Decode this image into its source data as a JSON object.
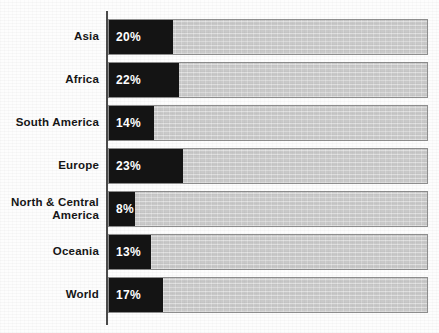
{
  "chart_data": {
    "type": "bar",
    "orientation": "horizontal",
    "title": "",
    "subtitle": "",
    "xlabel": "",
    "ylabel": "",
    "xlim": [
      0,
      100
    ],
    "grid": false,
    "legend": null,
    "value_suffix": "%",
    "categories": [
      "Asia",
      "Africa",
      "South America",
      "Europe",
      "North & Central\nAmerica",
      "Oceania",
      "World"
    ],
    "values": [
      20,
      22,
      14,
      23,
      8,
      13,
      17
    ],
    "labels": [
      "20%",
      "22%",
      "14%",
      "23%",
      "8%",
      "13%",
      "17%"
    ],
    "colors": {
      "bar_fill": "#141414",
      "bar_track": "#c9c9c9",
      "bar_border": "#8e8e8e",
      "value_text": "#ffffff",
      "category_text": "#161616",
      "axis": "#4a4a4a",
      "background": "#fdfdfd"
    }
  },
  "rows": [
    {
      "label": "Asia",
      "value": 20,
      "value_label": "20%"
    },
    {
      "label": "Africa",
      "value": 22,
      "value_label": "22%"
    },
    {
      "label": "South America",
      "value": 14,
      "value_label": "14%"
    },
    {
      "label": "Europe",
      "value": 23,
      "value_label": "23%"
    },
    {
      "label": "North & Central\nAmerica",
      "value": 8,
      "value_label": "8%"
    },
    {
      "label": "Oceania",
      "value": 13,
      "value_label": "13%"
    },
    {
      "label": "World",
      "value": 17,
      "value_label": "17%"
    }
  ],
  "geometry": {
    "row_top_start": 19,
    "row_height": 36,
    "row_pitch": 43,
    "track_left": 108,
    "track_width": 320,
    "px_per_percent": 3.2
  }
}
